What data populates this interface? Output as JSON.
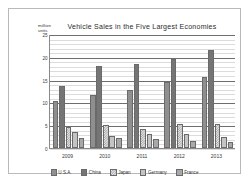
{
  "chart_data": {
    "type": "bar",
    "title": "Vehicle Sales in the Five Largest Economies",
    "xlabel": "",
    "ylabel": "million\nunits",
    "ylim": [
      0,
      25
    ],
    "yticks": [
      0,
      5,
      10,
      15,
      20,
      25
    ],
    "grid": true,
    "minor_grid": true,
    "legend_position": "bottom",
    "categories": [
      "2009",
      "2010",
      "2011",
      "2012",
      "2013"
    ],
    "series": [
      {
        "name": "U.S.A.",
        "values": [
          10.4,
          11.6,
          12.7,
          14.4,
          15.6
        ],
        "color": "#8f8f8f"
      },
      {
        "name": "China",
        "values": [
          13.6,
          18.0,
          18.5,
          19.6,
          21.5
        ],
        "color": "#757575"
      },
      {
        "name": "Japan",
        "values": [
          4.6,
          5.0,
          4.2,
          5.2,
          5.2
        ],
        "color": "#9a9a9a"
      },
      {
        "name": "Germany",
        "values": [
          3.6,
          2.7,
          3.1,
          3.0,
          2.4
        ],
        "color": "#c4c4c4"
      },
      {
        "name": "France",
        "values": [
          2.1,
          2.1,
          2.0,
          1.5,
          1.4
        ],
        "color": "#a8a8a8"
      }
    ]
  }
}
